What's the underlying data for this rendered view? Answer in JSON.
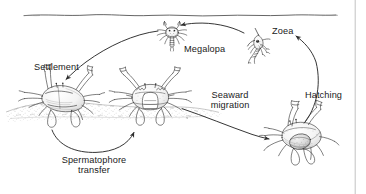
{
  "figure": {
    "ink_color": "#2b2b2b",
    "background_color": "#ffffff",
    "border_color": "#b8b8b8"
  },
  "water_surface": {
    "name": "water surface line"
  },
  "labels": {
    "settlement": "Settlement",
    "megalopa": "Megalopa",
    "zoea": "Zoea",
    "hatching": "Hatching",
    "seaward_migration_line1": "Seaward",
    "seaward_migration_line2": "migration",
    "spermatophore_line1": "Spermatophore",
    "spermatophore_line2": "transfer"
  },
  "stages": [
    {
      "id": "settled-crab",
      "label": "Settlement",
      "kind": "juvenile crab buried in sediment"
    },
    {
      "id": "mating-crab",
      "label": "Spermatophore transfer",
      "kind": "adult crab on sediment, front view"
    },
    {
      "id": "ovigerous-crab",
      "label": "Seaward migration",
      "kind": "ovigerous female crab with egg mass"
    },
    {
      "id": "zoea-larva",
      "label": "Zoea",
      "kind": "spiny planktonic zoea larva"
    },
    {
      "id": "megalopa-larva",
      "label": "Megalopa",
      "kind": "megalopa post-larva"
    }
  ],
  "arrows": [
    {
      "id": "arrow-settlement",
      "from": "megalopa-larva",
      "to": "settled-crab",
      "label": "Settlement"
    },
    {
      "id": "arrow-spermatophore",
      "from": "settled-crab",
      "to": "mating-crab",
      "label": "Spermatophore transfer"
    },
    {
      "id": "arrow-seaward-migration",
      "from": "mating-crab",
      "to": "ovigerous-crab",
      "label": "Seaward migration"
    },
    {
      "id": "arrow-hatching",
      "from": "ovigerous-crab",
      "to": "zoea-larva",
      "label": "Hatching"
    },
    {
      "id": "arrow-zoea-to-megalopa",
      "from": "zoea-larva",
      "to": "megalopa-larva",
      "label": ""
    }
  ]
}
